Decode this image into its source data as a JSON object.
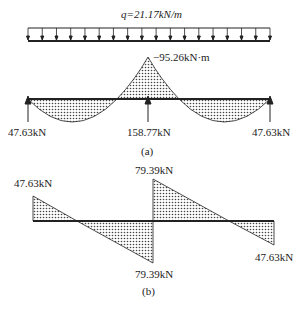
{
  "figure_a": {
    "load_label": "q=21.17kN/m",
    "moment_label": "−95.26kN·m",
    "reactions": [
      "47.63kN",
      "158.77kN",
      "47.63kN"
    ],
    "caption": "(a)"
  },
  "figure_b": {
    "labels": {
      "left_top": "47.63kN",
      "mid_top": "79.39kN",
      "mid_bottom": "79.39kN",
      "right_bottom": "47.63kN"
    },
    "caption": "(b)"
  }
}
